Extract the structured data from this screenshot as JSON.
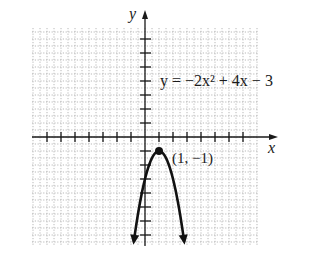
{
  "chart_data": {
    "type": "line",
    "title": "",
    "xlabel": "x",
    "ylabel": "y",
    "equation_label": "y = −2x² + 4x − 3",
    "equation": {
      "a": -2,
      "b": 4,
      "c": -3
    },
    "vertex": {
      "x": 1,
      "y": -1,
      "label": "(1, −1)"
    },
    "xlim": [
      -8,
      8.5
    ],
    "ylim": [
      -7.9,
      8.5
    ],
    "x_ticks": [
      -7,
      -6,
      -5,
      -4,
      -3,
      -2,
      -1,
      1,
      2,
      3,
      4,
      5,
      6,
      7
    ],
    "y_ticks": [
      -7,
      -6,
      -5,
      -4,
      -3,
      -2,
      -1,
      1,
      2,
      3,
      4,
      5,
      6,
      7
    ],
    "tick_labels_shown": false,
    "grid": true,
    "grid_style": "dotted",
    "grid_minor_step": 0.5,
    "curve_domain": [
      -0.8,
      2.8
    ],
    "curve_end_arrows": true,
    "sample_points": [
      {
        "x": -0.8,
        "y": -7.48
      },
      {
        "x": -0.5,
        "y": -5.5
      },
      {
        "x": 0,
        "y": -3
      },
      {
        "x": 0.5,
        "y": -1.5
      },
      {
        "x": 1,
        "y": -1
      },
      {
        "x": 1.5,
        "y": -1.5
      },
      {
        "x": 2,
        "y": -3
      },
      {
        "x": 2.5,
        "y": -5.5
      },
      {
        "x": 2.8,
        "y": -7.48
      }
    ]
  },
  "colors": {
    "axis": "#1a1a1a",
    "curve": "#111111",
    "grid": "#b8b8b8",
    "background": "#ffffff"
  }
}
